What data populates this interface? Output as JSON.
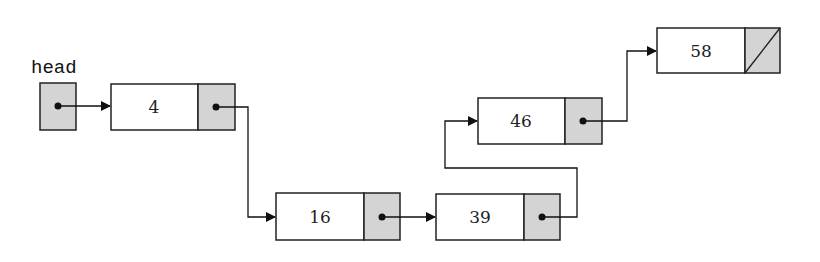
{
  "diagram": {
    "type": "singly-linked-list",
    "head_label": "head",
    "colors": {
      "pointer_cell": "#d4d4d4",
      "data_cell": "#ffffff",
      "stroke": "#222222"
    },
    "nodes": [
      {
        "value": "4",
        "next": "16"
      },
      {
        "value": "16",
        "next": "39"
      },
      {
        "value": "39",
        "next": "46"
      },
      {
        "value": "46",
        "next": "58"
      },
      {
        "value": "58",
        "next": null
      }
    ]
  }
}
